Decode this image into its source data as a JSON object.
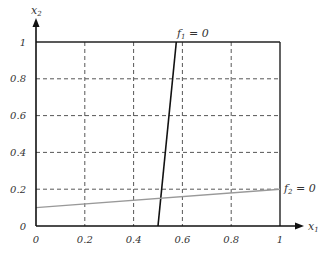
{
  "chart_data": {
    "type": "line",
    "title": "",
    "xlabel": "x1",
    "ylabel": "x2",
    "xlim": [
      0,
      1
    ],
    "ylim": [
      0,
      1
    ],
    "grid": true,
    "x_ticks": [
      {
        "value": 0,
        "label": "0"
      },
      {
        "value": 0.2,
        "label": "0.2"
      },
      {
        "value": 0.4,
        "label": "0.4"
      },
      {
        "value": 0.6,
        "label": "0.6"
      },
      {
        "value": 0.8,
        "label": "0.8"
      },
      {
        "value": 1,
        "label": "1"
      }
    ],
    "y_ticks": [
      {
        "value": 0,
        "label": "0"
      },
      {
        "value": 0.2,
        "label": "0.2"
      },
      {
        "value": 0.4,
        "label": "0.4"
      },
      {
        "value": 0.6,
        "label": "0.6"
      },
      {
        "value": 0.8,
        "label": "0.8"
      },
      {
        "value": 1,
        "label": "1"
      }
    ],
    "series": [
      {
        "name": "f1 = 0",
        "label_main": "f",
        "label_sub": "1",
        "label_rest": " = 0",
        "color": "#111111",
        "x": [
          0.5,
          0.575
        ],
        "y": [
          0,
          1
        ],
        "label_position": "top"
      },
      {
        "name": "f2 = 0",
        "label_main": "f",
        "label_sub": "2",
        "label_rest": " = 0",
        "color": "#999999",
        "x": [
          0,
          1
        ],
        "y": [
          0.1,
          0.2
        ],
        "label_position": "right"
      }
    ],
    "axis_labels": {
      "x_main": "x",
      "x_sub": "1",
      "y_main": "x",
      "y_sub": "2"
    }
  }
}
